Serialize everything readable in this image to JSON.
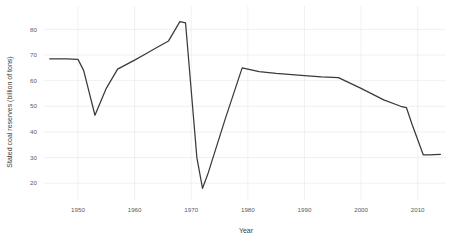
{
  "chart_data": {
    "type": "line",
    "title": "",
    "xlabel": "Year",
    "ylabel": "Stated coal reserves (billion of tons)",
    "xlim": [
      1944,
      2015
    ],
    "ylim": [
      15,
      86
    ],
    "xticks": [
      1950,
      1960,
      1970,
      1980,
      1990,
      2000,
      2010
    ],
    "xtick_labels": [
      "1950",
      "1960",
      "1970",
      "1980",
      "1990",
      "2000",
      "2010"
    ],
    "yticks": [
      20,
      30,
      40,
      50,
      60,
      70,
      80
    ],
    "ytick_labels": [
      "20",
      "30",
      "40",
      "50",
      "60",
      "70",
      "80"
    ],
    "grid": true,
    "legend": "none",
    "line_color": "#3a3a3a",
    "grid_color": "#e9e9e9",
    "background_color": "#ffffff",
    "series": [
      {
        "name": "Stated coal reserves",
        "x": [
          1945,
          1948,
          1950,
          1951,
          1953,
          1955,
          1957,
          1960,
          1962,
          1964,
          1966,
          1968,
          1969,
          1971,
          1972,
          1973,
          1976,
          1979,
          1980,
          1982,
          1985,
          1990,
          1993,
          1996,
          2000,
          2004,
          2007,
          2008,
          2009,
          2011,
          2012,
          2014
        ],
        "y": [
          68.5,
          68.5,
          68.3,
          64.0,
          46.5,
          57.0,
          64.5,
          68.0,
          70.5,
          73.0,
          75.5,
          83.0,
          82.5,
          30.0,
          18.0,
          24.0,
          45.0,
          65.0,
          64.5,
          63.5,
          62.8,
          62.0,
          61.5,
          61.2,
          57.0,
          52.5,
          50.0,
          49.5,
          43.0,
          31.0,
          31.0,
          31.2
        ]
      }
    ]
  }
}
